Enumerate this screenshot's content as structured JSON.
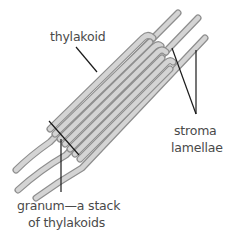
{
  "diagram": {
    "labels": {
      "thylakoid": "thylakoid",
      "stroma_line1": "stroma",
      "stroma_line2": "lamellae",
      "granum_line1": "granum—a stack",
      "granum_line2": "of thylakoids"
    },
    "colors": {
      "membrane_outline": "#8e8e8e",
      "membrane_fill": "#d4d4d4",
      "leader_line": "#1a1a1a",
      "label_text": "#4a4a4a",
      "background": "#ffffff"
    },
    "structure": {
      "granum_thylakoid_count": 7,
      "stroma_lamellae_count": 3
    }
  }
}
